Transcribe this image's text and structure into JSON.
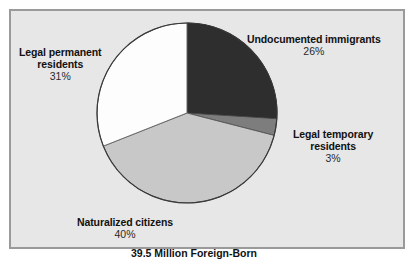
{
  "figure": {
    "caption": "39.5 Million Foreign-Born",
    "partial_top_text": "",
    "background_color": "#e7e7e7",
    "border_color": "#9a9a9a"
  },
  "chart_data": {
    "type": "pie",
    "title": "39.5 Million Foreign-Born",
    "total_label": "39.5 Million Foreign-Born",
    "total_millions": 39.5,
    "unit": "percent",
    "start_angle_deg": 0,
    "direction": "clockwise",
    "legend_position": "outside-labels",
    "grid": false,
    "categories": [
      "Undocumented immigrants",
      "Legal temporary residents",
      "Naturalized citizens",
      "Legal permanent residents"
    ],
    "values": [
      26,
      3,
      40,
      31
    ],
    "value_labels": [
      "26%",
      "3%",
      "40%",
      "31%"
    ],
    "colors": [
      "#2e2e2e",
      "#7d7d7d",
      "#c8c8c8",
      "#fdfdfd"
    ],
    "slices": [
      {
        "name": "Undocumented immigrants",
        "value": 26,
        "label": "26%",
        "color": "#2e2e2e"
      },
      {
        "name": "Legal temporary residents",
        "value": 3,
        "label": "3%",
        "color": "#7d7d7d"
      },
      {
        "name": "Naturalized citizens",
        "value": 40,
        "label": "40%",
        "color": "#c8c8c8"
      },
      {
        "name": "Legal permanent residents",
        "value": 31,
        "label": "31%",
        "color": "#fdfdfd"
      }
    ]
  },
  "labels": {
    "undocumented": {
      "line1": "Undocumented immigrants",
      "value": "26%"
    },
    "permanent": {
      "line1": "Legal permanent",
      "line2": "residents",
      "value": "31%"
    },
    "temporary": {
      "line1": "Legal temporary",
      "line2": "residents",
      "value": "3%"
    },
    "naturalized": {
      "line1": "Naturalized citizens",
      "value": "40%"
    }
  }
}
